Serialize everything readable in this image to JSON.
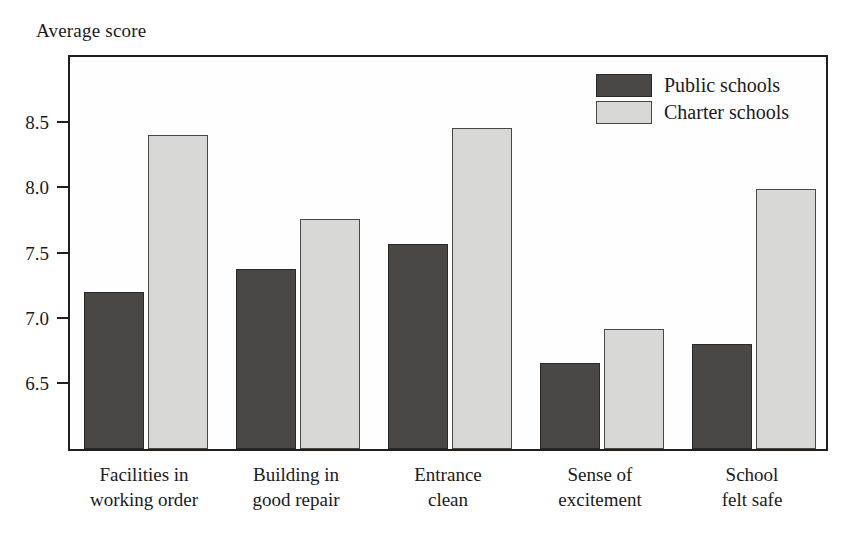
{
  "chart_data": {
    "type": "bar",
    "title": "",
    "subtitle": "",
    "xlabel": "",
    "ylabel": "Average score",
    "categories": [
      "Facilities in\nworking order",
      "Building in\ngood repair",
      "Entrance\nclean",
      "Sense of\nexcitement",
      "School\nfelt safe"
    ],
    "category_lines": [
      [
        "Facilities in",
        "working order"
      ],
      [
        "Building in",
        "good repair"
      ],
      [
        "Entrance",
        "clean"
      ],
      [
        "Sense of",
        "excitement"
      ],
      [
        "School",
        "felt safe"
      ]
    ],
    "series": [
      {
        "name": "Public schools",
        "color": "#4a4745",
        "values": [
          7.16,
          7.34,
          7.53,
          6.62,
          6.76
        ]
      },
      {
        "name": "Charter schools",
        "color": "#d8d8d6",
        "values": [
          8.36,
          7.72,
          8.42,
          6.88,
          7.95
        ]
      }
    ],
    "ylim": [
      5.96,
      8.99
    ],
    "yticks": [
      6.5,
      7.0,
      7.5,
      8.0,
      8.5
    ],
    "ytick_labels": [
      "6.5",
      "7.0",
      "7.5",
      "8.0",
      "8.5"
    ],
    "grid": false,
    "legend_position": "top-right",
    "axis_color": "#22201e",
    "background": "#ffffff"
  },
  "legend": {
    "items": [
      {
        "label": "Public schools",
        "swatch": "public"
      },
      {
        "label": "Charter schools",
        "swatch": "charter"
      }
    ]
  }
}
